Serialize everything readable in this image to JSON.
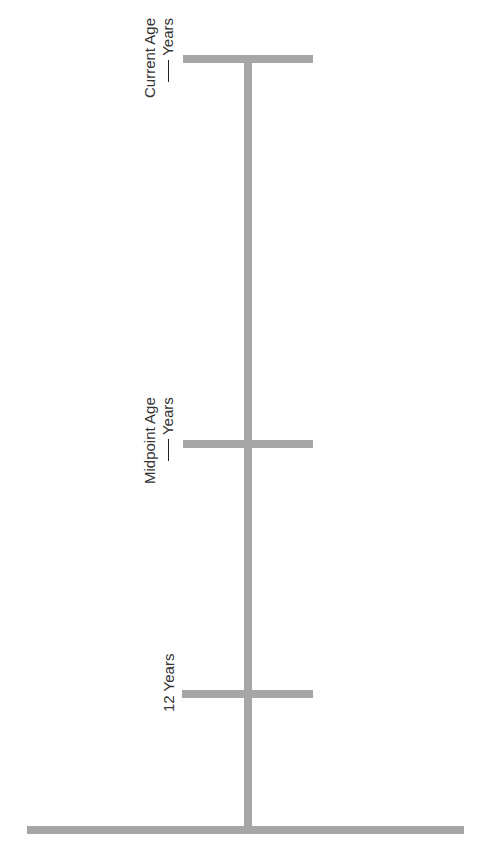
{
  "diagram": {
    "type": "timeline",
    "orientation": "vertical",
    "bar_color": "#a6a6a6",
    "text_color": "#333333",
    "markers": [
      {
        "id": "current",
        "line1": "Current Age",
        "line2": "Years",
        "has_blank": true
      },
      {
        "id": "midpoint",
        "line1": "Midpoint Age",
        "line2": "Years",
        "has_blank": true
      },
      {
        "id": "twelve",
        "line1": "12 Years"
      }
    ],
    "base": "baseline"
  }
}
